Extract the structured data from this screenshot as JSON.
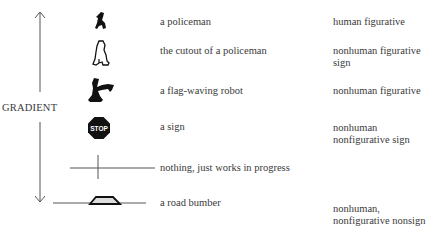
{
  "axis": {
    "label": "GRADIENT",
    "direction": "bidirectional-vertical"
  },
  "rows": [
    {
      "icon": "policeman-icon",
      "description": "a policeman",
      "category": "human figurative"
    },
    {
      "icon": "policeman-cutout-icon",
      "description": "the cutout of a policeman",
      "category": "nonhuman figurative sign"
    },
    {
      "icon": "flag-waving-robot-icon",
      "description": "a flag-waving robot",
      "category": "nonhuman figurative"
    },
    {
      "icon": "stop-sign-icon",
      "description": "a sign",
      "category": "nonhuman nonfigurative sign",
      "icon_text": "STOP"
    },
    {
      "icon": "crossed-lines-icon",
      "description": "nothing, just works in progress",
      "category": ""
    },
    {
      "icon": "road-bump-icon",
      "description": "a road bumber",
      "category": "nonhuman, nonfigurative nonsign"
    }
  ],
  "categories_lines": {
    "row1": [
      "nonhuman figurative",
      "sign"
    ],
    "row3": [
      "nonhuman",
      "nonfigurative sign"
    ],
    "row5": [
      "nonhuman,",
      "nonfigurative nonsign"
    ]
  }
}
